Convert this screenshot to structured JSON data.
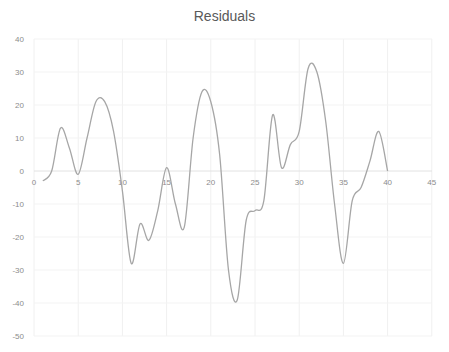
{
  "chart_data": {
    "type": "line",
    "title": "Residuals",
    "xlabel": "",
    "ylabel": "",
    "xlim": [
      0,
      45
    ],
    "ylim": [
      -50,
      40
    ],
    "x_ticks": [
      0,
      5,
      10,
      15,
      20,
      25,
      30,
      35,
      40,
      45
    ],
    "y_ticks": [
      40,
      30,
      20,
      10,
      0,
      -10,
      -20,
      -30,
      -40,
      -50
    ],
    "grid": true,
    "legend": null,
    "smooth": true,
    "line_color": "#a6a6a6",
    "series": [
      {
        "name": "Residuals",
        "x": [
          1,
          2,
          3,
          4,
          5,
          6,
          7,
          8,
          9,
          10,
          11,
          12,
          13,
          14,
          15,
          16,
          17,
          18,
          19,
          20,
          21,
          22,
          23,
          24,
          25,
          26,
          27,
          28,
          29,
          30,
          31,
          32,
          33,
          34,
          35,
          36,
          37,
          38,
          39,
          40
        ],
        "values": [
          -3,
          0,
          13,
          7,
          -1,
          10,
          21,
          21,
          12,
          -6,
          -28,
          -16,
          -21,
          -12,
          1,
          -10,
          -17,
          10,
          24,
          21,
          5,
          -30,
          -39,
          -15,
          -12,
          -9,
          17,
          1,
          8,
          12,
          31,
          30,
          15,
          -10,
          -28,
          -9,
          -5,
          3,
          12,
          0
        ]
      }
    ]
  },
  "title": "Residuals"
}
